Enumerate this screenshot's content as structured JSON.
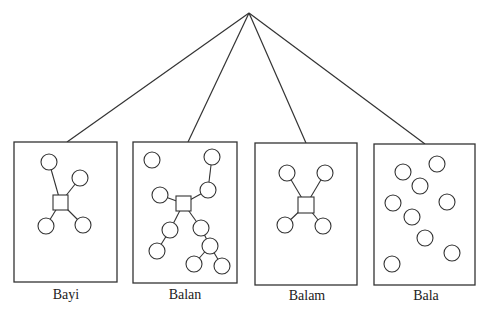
{
  "diagram": {
    "apex": {
      "x": 249,
      "y": 13
    },
    "stroke_color": "#333333",
    "panels": [
      {
        "label": "Bayi",
        "box": {
          "x": 14,
          "y": 142,
          "w": 103,
          "h": 140
        },
        "attach": {
          "x": 67,
          "y": 142
        },
        "squares": [
          {
            "x": 53,
            "y": 195,
            "s": 15
          }
        ],
        "circles": [
          {
            "x": 49,
            "y": 162
          },
          {
            "x": 80,
            "y": 178
          },
          {
            "x": 46,
            "y": 226
          },
          {
            "x": 83,
            "y": 225
          }
        ],
        "edges": [
          [
            0,
            "s0"
          ],
          [
            1,
            "s0"
          ],
          [
            2,
            "s0"
          ],
          [
            3,
            "s0"
          ]
        ]
      },
      {
        "label": "Balan",
        "box": {
          "x": 133,
          "y": 142,
          "w": 104,
          "h": 141
        },
        "attach": {
          "x": 188,
          "y": 142
        },
        "squares": [
          {
            "x": 176,
            "y": 196,
            "s": 15
          }
        ],
        "circles": [
          {
            "x": 152,
            "y": 160
          },
          {
            "x": 212,
            "y": 157
          },
          {
            "x": 208,
            "y": 190
          },
          {
            "x": 160,
            "y": 195
          },
          {
            "x": 170,
            "y": 230
          },
          {
            "x": 157,
            "y": 251
          },
          {
            "x": 201,
            "y": 228
          },
          {
            "x": 210,
            "y": 246
          },
          {
            "x": 194,
            "y": 264
          },
          {
            "x": 222,
            "y": 266
          }
        ],
        "edges": [
          [
            1,
            2
          ],
          [
            2,
            "s0"
          ],
          [
            3,
            "s0"
          ],
          [
            4,
            "s0"
          ],
          [
            4,
            5
          ],
          [
            6,
            "s0"
          ],
          [
            6,
            7
          ],
          [
            7,
            8
          ],
          [
            7,
            9
          ]
        ]
      },
      {
        "label": "Balam",
        "box": {
          "x": 255,
          "y": 143,
          "w": 102,
          "h": 142
        },
        "attach": {
          "x": 306,
          "y": 143
        },
        "squares": [
          {
            "x": 298,
            "y": 197,
            "s": 16
          }
        ],
        "circles": [
          {
            "x": 287,
            "y": 173
          },
          {
            "x": 325,
            "y": 173
          },
          {
            "x": 285,
            "y": 225
          },
          {
            "x": 323,
            "y": 226
          }
        ],
        "edges": [
          [
            0,
            "s0"
          ],
          [
            1,
            "s0"
          ],
          [
            2,
            "s0"
          ],
          [
            3,
            "s0"
          ]
        ]
      },
      {
        "label": "Bala",
        "box": {
          "x": 374,
          "y": 144,
          "w": 101,
          "h": 141
        },
        "attach": {
          "x": 425,
          "y": 144
        },
        "squares": [],
        "circles": [
          {
            "x": 403,
            "y": 172
          },
          {
            "x": 437,
            "y": 164
          },
          {
            "x": 420,
            "y": 186
          },
          {
            "x": 393,
            "y": 203
          },
          {
            "x": 447,
            "y": 202
          },
          {
            "x": 412,
            "y": 217
          },
          {
            "x": 425,
            "y": 238
          },
          {
            "x": 452,
            "y": 253
          },
          {
            "x": 392,
            "y": 264
          }
        ],
        "edges": []
      }
    ],
    "circle_radius": 8
  }
}
